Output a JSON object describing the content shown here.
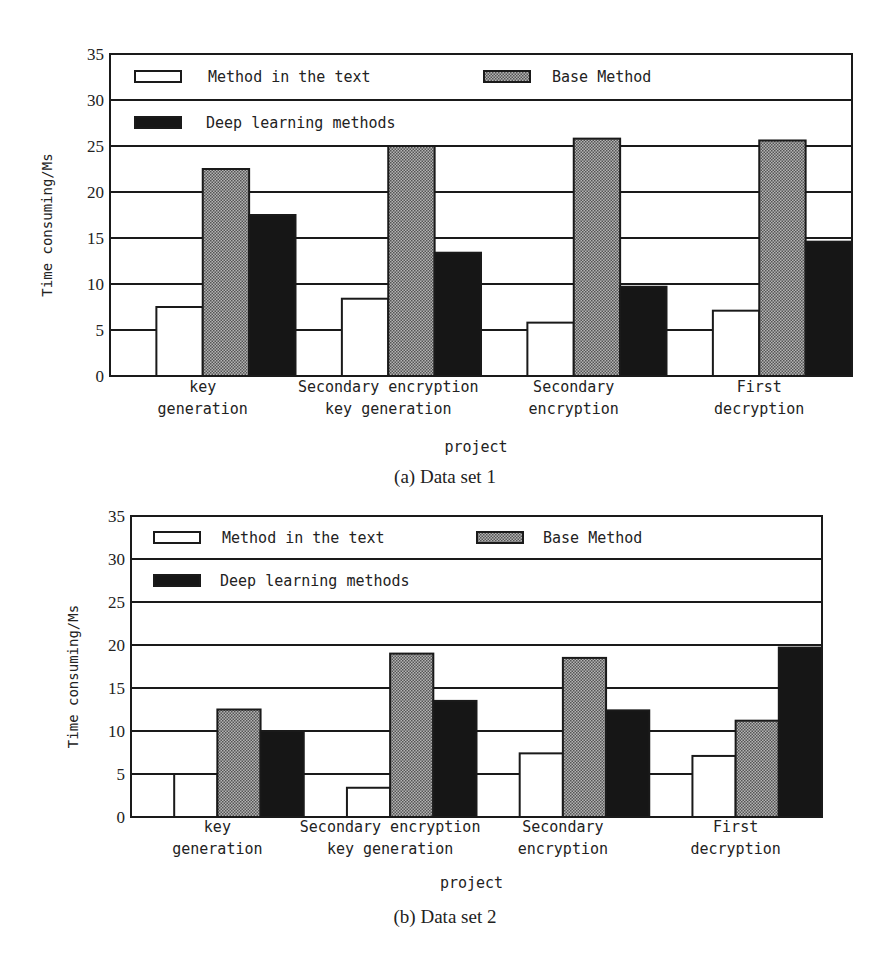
{
  "chart_data": [
    {
      "type": "bar",
      "title": "(a) Data set 1",
      "xlabel": "project",
      "ylabel": "Time consuming/Ms",
      "ylim": [
        0,
        35
      ],
      "yticks": [
        0,
        5,
        10,
        15,
        20,
        25,
        30,
        35
      ],
      "grid": true,
      "legend_position": "top-inside",
      "categories": [
        [
          "key",
          "generation"
        ],
        [
          "Secondary encryption",
          "key generation"
        ],
        [
          "Secondary",
          "encryption"
        ],
        [
          "First",
          "decryption"
        ]
      ],
      "series": [
        {
          "name": "Method in the text",
          "style": "white",
          "values": [
            7.5,
            8.4,
            5.8,
            7.1
          ]
        },
        {
          "name": "Base Method",
          "style": "hatched",
          "values": [
            22.5,
            25.0,
            25.8,
            25.6
          ]
        },
        {
          "name": "Deep learning methods",
          "style": "black",
          "values": [
            17.5,
            13.4,
            9.7,
            14.6
          ]
        }
      ]
    },
    {
      "type": "bar",
      "title": "(b) Data set 2",
      "xlabel": "project",
      "ylabel": "Time consuming/Ms",
      "ylim": [
        0,
        35
      ],
      "yticks": [
        0,
        5,
        10,
        15,
        20,
        25,
        30,
        35
      ],
      "grid": true,
      "legend_position": "top-inside",
      "categories": [
        [
          "key",
          "generation"
        ],
        [
          "Secondary encryption",
          "key generation"
        ],
        [
          "Secondary",
          "encryption"
        ],
        [
          "First",
          "decryption"
        ]
      ],
      "series": [
        {
          "name": "Method in the text",
          "style": "white",
          "values": [
            5.0,
            3.4,
            7.4,
            7.1
          ]
        },
        {
          "name": "Base Method",
          "style": "hatched",
          "values": [
            12.5,
            19.0,
            18.5,
            11.2
          ]
        },
        {
          "name": "Deep learning methods",
          "style": "black",
          "values": [
            10.0,
            13.5,
            12.4,
            19.7
          ]
        }
      ]
    }
  ],
  "captions": {
    "a": "(a) Data set 1",
    "b": "(b) Data set 2"
  },
  "colors": {
    "frame": "#1a1a1a",
    "hatched_fill": "#8c8c8c",
    "black_fill": "#161616",
    "white_fill": "#ffffff"
  }
}
